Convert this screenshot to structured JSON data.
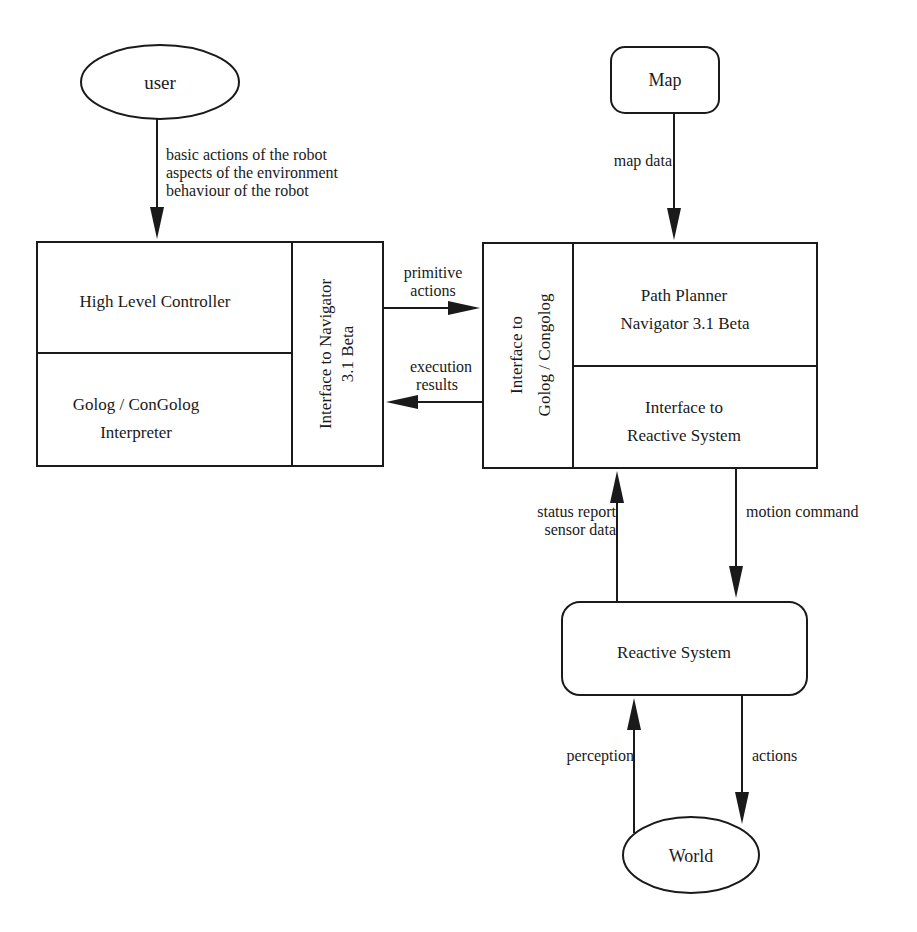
{
  "diagram": {
    "nodes": {
      "user": {
        "label": "user"
      },
      "map": {
        "label": "Map"
      },
      "controller": {
        "top_label": "High Level Controller",
        "bottom_label_line1": "Golog / ConGolog",
        "bottom_label_line2": "Interpreter",
        "side_label_line1": "Interface to Navigator",
        "side_label_line2": "3.1 Beta"
      },
      "navigator": {
        "side_label_line1": "Interface to",
        "side_label_line2": "Golog / Congolog",
        "top_label_line1": "Path Planner",
        "top_label_line2": "Navigator 3.1 Beta",
        "bottom_label_line1": "Interface to",
        "bottom_label_line2": "Reactive System"
      },
      "reactive": {
        "label": "Reactive System"
      },
      "world": {
        "label": "World"
      }
    },
    "edges": {
      "user_to_controller": {
        "line1": "basic actions of the robot",
        "line2": "aspects of the environment",
        "line3": "behaviour of the robot"
      },
      "map_to_navigator": {
        "label": "map data"
      },
      "controller_to_navigator": {
        "line1": "primitive",
        "line2": "actions"
      },
      "navigator_to_controller": {
        "line1": "execution",
        "line2": "results"
      },
      "reactive_to_navigator": {
        "line1": "status report",
        "line2": "sensor data"
      },
      "navigator_to_reactive": {
        "label": "motion command"
      },
      "world_to_reactive": {
        "label": "perception"
      },
      "reactive_to_world": {
        "label": "actions"
      }
    }
  }
}
